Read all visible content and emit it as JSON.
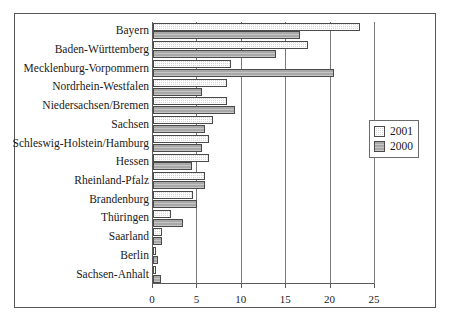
{
  "chart_data": {
    "type": "bar",
    "orientation": "horizontal",
    "title": "",
    "xlabel": "",
    "ylabel": "",
    "xlim": [
      0,
      25
    ],
    "xticks": [
      0,
      5,
      10,
      15,
      20,
      25
    ],
    "xtick_labels": [
      "0",
      "5",
      "10",
      "15",
      "20",
      "25"
    ],
    "grid": true,
    "grid_axis": "x",
    "legend_position": "right",
    "categories": [
      "Bayern",
      "Baden-Württemberg",
      "Mecklenburg-Vorpommern",
      "Nordrhein-Westfalen",
      "Niedersachsen/Bremen",
      "Sachsen",
      "Schleswig-Holstein/Hamburg",
      "Hessen",
      "Rheinland-Pfalz",
      "Brandenburg",
      "Thüringen",
      "Saarland",
      "Berlin",
      "Sachsen-Anhalt"
    ],
    "series": [
      {
        "name": "2001",
        "color": "#d7d7d7",
        "values": [
          23.3,
          17.5,
          8.8,
          8.3,
          8.3,
          6.8,
          6.3,
          6.3,
          5.9,
          4.5,
          2.0,
          1.0,
          0.3,
          0.3
        ]
      },
      {
        "name": "2000",
        "color": "#a8a8a8",
        "values": [
          16.5,
          13.8,
          20.4,
          5.5,
          9.2,
          5.9,
          5.5,
          4.4,
          5.9,
          5.0,
          3.4,
          1.0,
          0.6,
          0.9
        ]
      }
    ]
  },
  "legend": {
    "entries": [
      {
        "label": "2001"
      },
      {
        "label": "2000"
      }
    ]
  }
}
